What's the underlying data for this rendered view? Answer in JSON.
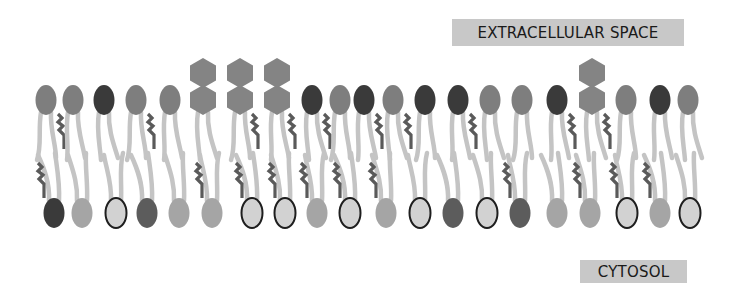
{
  "labels": {
    "extracellular": "EXTRACELLULAR SPACE",
    "cytosol": "CYTOSOL"
  },
  "colors": {
    "head_dark": "#3a3a3a",
    "head_medium": "#7e7e7e",
    "head_darkmed": "#5c5c5c",
    "head_light": "#a5a5a5",
    "head_outlined_fill": "#d2d2d2",
    "head_outline": "#1e1e1e",
    "hexagon": "#848484",
    "tail": "#c4c4c4",
    "cholesterol": "#5a5a5a",
    "label_bg": "#c8c8c8"
  },
  "outer_leaflet": [
    {
      "x": 46,
      "type": "medium",
      "chol": true
    },
    {
      "x": 73,
      "type": "medium"
    },
    {
      "x": 104,
      "type": "dark"
    },
    {
      "x": 136,
      "type": "medium",
      "chol": true
    },
    {
      "x": 170,
      "type": "medium"
    },
    {
      "x": 203,
      "type": "glyco"
    },
    {
      "x": 240,
      "type": "glyco",
      "chol": true
    },
    {
      "x": 277,
      "type": "glyco",
      "chol": true
    },
    {
      "x": 312,
      "type": "dark",
      "chol": true
    },
    {
      "x": 340,
      "type": "medium"
    },
    {
      "x": 364,
      "type": "dark",
      "chol": true
    },
    {
      "x": 393,
      "type": "medium",
      "chol": true
    },
    {
      "x": 425,
      "type": "dark"
    },
    {
      "x": 458,
      "type": "dark",
      "chol": true
    },
    {
      "x": 490,
      "type": "medium"
    },
    {
      "x": 522,
      "type": "medium"
    },
    {
      "x": 557,
      "type": "dark",
      "chol": true
    },
    {
      "x": 592,
      "type": "glyco",
      "chol": true
    },
    {
      "x": 626,
      "type": "medium"
    },
    {
      "x": 660,
      "type": "dark"
    },
    {
      "x": 688,
      "type": "medium"
    }
  ],
  "inner_leaflet": [
    {
      "x": 54,
      "type": "dark",
      "chol": true
    },
    {
      "x": 82,
      "type": "light"
    },
    {
      "x": 116,
      "type": "outlined"
    },
    {
      "x": 147,
      "type": "darkmed"
    },
    {
      "x": 179,
      "type": "light"
    },
    {
      "x": 212,
      "type": "light",
      "chol": true
    },
    {
      "x": 252,
      "type": "outlined",
      "chol": true
    },
    {
      "x": 285,
      "type": "outlined",
      "chol": true
    },
    {
      "x": 317,
      "type": "light",
      "chol": true
    },
    {
      "x": 350,
      "type": "outlined",
      "chol": true
    },
    {
      "x": 386,
      "type": "light",
      "chol": true
    },
    {
      "x": 420,
      "type": "outlined"
    },
    {
      "x": 453,
      "type": "darkmed"
    },
    {
      "x": 487,
      "type": "outlined"
    },
    {
      "x": 520,
      "type": "darkmed",
      "chol": true
    },
    {
      "x": 557,
      "type": "light"
    },
    {
      "x": 590,
      "type": "light",
      "chol": true
    },
    {
      "x": 627,
      "type": "outlined",
      "chol": true
    },
    {
      "x": 660,
      "type": "light",
      "chol": true
    },
    {
      "x": 690,
      "type": "outlined"
    }
  ]
}
